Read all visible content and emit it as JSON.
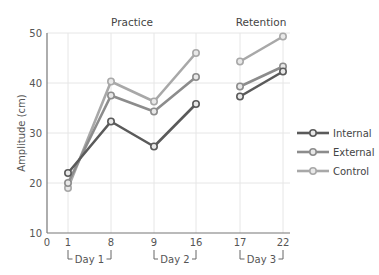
{
  "chart_data": {
    "type": "line",
    "title": "",
    "panel_titles": [
      "Practice",
      "Retention"
    ],
    "xlabel": "",
    "ylabel": "Amplitude (cm)",
    "ylim": [
      10,
      50
    ],
    "yticks": [
      10,
      20,
      30,
      40,
      50
    ],
    "xticks": [
      "0",
      "1",
      "8",
      "9",
      "16",
      "17",
      "22"
    ],
    "x": [
      1,
      8,
      9,
      16,
      17,
      22
    ],
    "day_groups": [
      {
        "label": "Day 1",
        "from": 1,
        "to": 8
      },
      {
        "label": "Day 2",
        "from": 9,
        "to": 16
      },
      {
        "label": "Day 3",
        "from": 17,
        "to": 22
      }
    ],
    "segments_note": "Practice (1-16) connected; Retention (17-22) separate segment",
    "series": [
      {
        "name": "Internal",
        "color": "#5a5a5a",
        "values": [
          22.0,
          32.3,
          27.3,
          35.8,
          37.3,
          42.3
        ]
      },
      {
        "name": "External",
        "color": "#8c8c8c",
        "values": [
          20.0,
          37.5,
          34.3,
          41.2,
          39.3,
          43.3
        ]
      },
      {
        "name": "Control",
        "color": "#a8a8a8",
        "values": [
          19.0,
          40.3,
          36.3,
          46.0,
          44.3,
          49.3
        ]
      }
    ],
    "grid": true,
    "legend_position": "right"
  }
}
